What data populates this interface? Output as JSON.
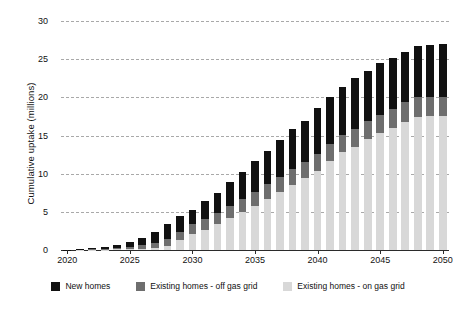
{
  "chart_data": {
    "type": "bar",
    "stacked": true,
    "title": "",
    "xlabel": "",
    "ylabel": "Cumulative uptake (millions)",
    "ylim": [
      0,
      30
    ],
    "ytick_values": [
      0,
      5,
      10,
      15,
      20,
      25,
      30
    ],
    "ytick_labels": [
      "0",
      "5",
      "10",
      "15",
      "20",
      "25",
      "30"
    ],
    "grid": true,
    "grid_style": "dashed horizontal",
    "legend_position": "bottom",
    "categories": [
      "2020",
      "2021",
      "2022",
      "2023",
      "2024",
      "2025",
      "2026",
      "2027",
      "2028",
      "2029",
      "2030",
      "2031",
      "2032",
      "2033",
      "2034",
      "2035",
      "2036",
      "2037",
      "2038",
      "2039",
      "2040",
      "2041",
      "2042",
      "2043",
      "2044",
      "2045",
      "2046",
      "2047",
      "2048",
      "2049",
      "2050"
    ],
    "xtick_labels": [
      "2020",
      "2025",
      "2030",
      "2035",
      "2040",
      "2045",
      "2050"
    ],
    "series": [
      {
        "name": "Existing homes - on gas grid",
        "color": "#d8d8d8",
        "values": [
          0.0,
          0.02,
          0.04,
          0.06,
          0.08,
          0.1,
          0.15,
          0.25,
          0.5,
          1.3,
          2.1,
          2.6,
          3.4,
          4.2,
          5.0,
          5.8,
          6.7,
          7.6,
          8.5,
          9.4,
          10.4,
          11.7,
          12.8,
          13.5,
          14.5,
          15.3,
          16.0,
          16.8,
          17.4,
          17.5,
          17.5
        ]
      },
      {
        "name": "Existing homes - off gas grid",
        "color": "#6e6e6e",
        "values": [
          0.0,
          0.02,
          0.05,
          0.1,
          0.2,
          0.35,
          0.5,
          0.7,
          0.9,
          1.1,
          1.3,
          1.4,
          1.5,
          1.6,
          1.7,
          1.8,
          1.9,
          2.0,
          2.1,
          2.1,
          2.2,
          2.2,
          2.3,
          2.3,
          2.4,
          2.4,
          2.5,
          2.6,
          2.6,
          2.6,
          2.6
        ]
      },
      {
        "name": "New homes",
        "color": "#111111",
        "values": [
          0.03,
          0.08,
          0.15,
          0.28,
          0.4,
          0.6,
          0.9,
          1.4,
          2.0,
          2.0,
          1.9,
          2.4,
          2.6,
          3.1,
          3.5,
          4.0,
          4.4,
          4.8,
          5.2,
          5.4,
          6.0,
          6.2,
          6.3,
          6.7,
          6.6,
          6.8,
          6.7,
          6.6,
          6.7,
          6.8,
          6.9
        ]
      }
    ],
    "totals": [
      0.03,
      0.12,
      0.24,
      0.44,
      0.68,
      1.05,
      1.55,
      2.35,
      3.4,
      4.4,
      5.3,
      6.4,
      7.5,
      8.9,
      10.2,
      11.6,
      13.0,
      14.4,
      15.8,
      16.9,
      18.6,
      20.1,
      21.4,
      22.5,
      23.5,
      24.5,
      25.2,
      26.0,
      26.7,
      26.9,
      27.0
    ]
  },
  "legend": {
    "items": [
      {
        "label": "New homes",
        "color": "#111111"
      },
      {
        "label": "Existing homes - off gas grid",
        "color": "#6e6e6e"
      },
      {
        "label": "Existing homes - on gas grid",
        "color": "#d8d8d8"
      }
    ]
  }
}
